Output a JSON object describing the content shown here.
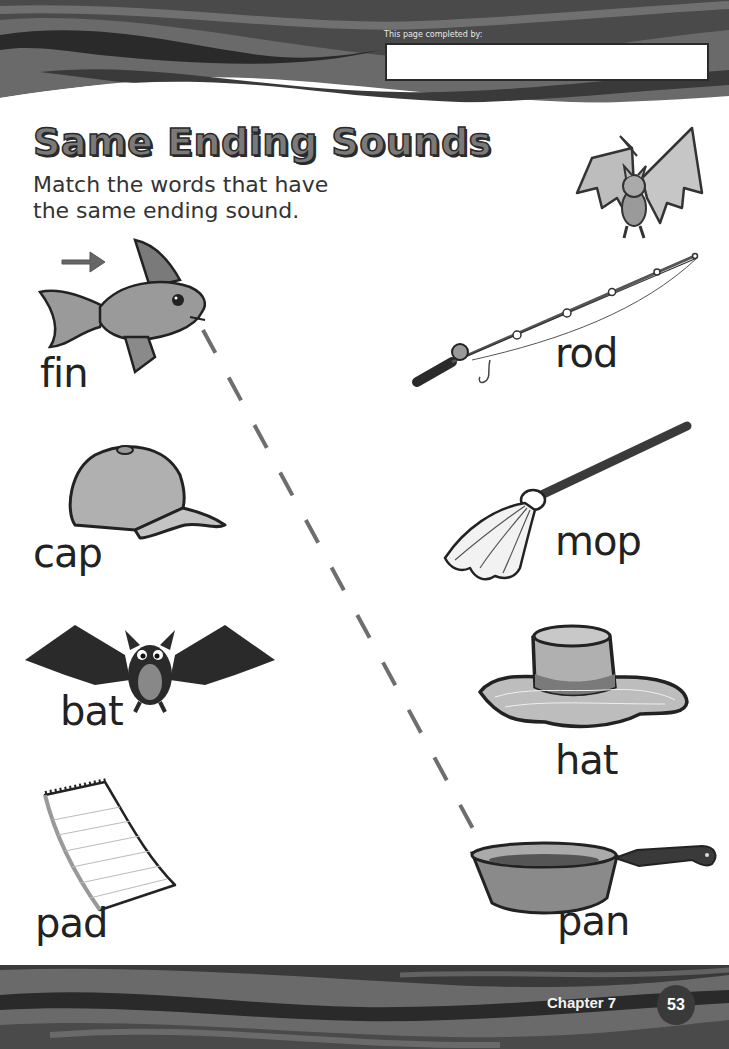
{
  "header": {
    "completed_by_label": "This page completed by:",
    "completed_by_value": ""
  },
  "title": "Same Ending Sounds",
  "instructions": {
    "line1": "Match the words that have",
    "line2": "the same ending sound."
  },
  "left_column": [
    {
      "word": "fin",
      "picture": "fish"
    },
    {
      "word": "cap",
      "picture": "baseball-cap"
    },
    {
      "word": "bat",
      "picture": "bat-animal"
    },
    {
      "word": "pad",
      "picture": "notepad"
    }
  ],
  "right_column": [
    {
      "word": "rod",
      "picture": "fishing-rod"
    },
    {
      "word": "mop",
      "picture": "mop"
    },
    {
      "word": "hat",
      "picture": "hat"
    },
    {
      "word": "pan",
      "picture": "frying-pan"
    }
  ],
  "example_match": {
    "from": "fin",
    "to": "pan",
    "style": "dashed"
  },
  "footer": {
    "chapter": "Chapter 7",
    "page_number": "53"
  },
  "colors": {
    "banner_dark": "#2e2e2e",
    "banner_mid": "#5a5a5a",
    "banner_light": "#8a8a8a",
    "title_fill": "#7a7a7a",
    "dash_line": "#6e6e6e"
  }
}
